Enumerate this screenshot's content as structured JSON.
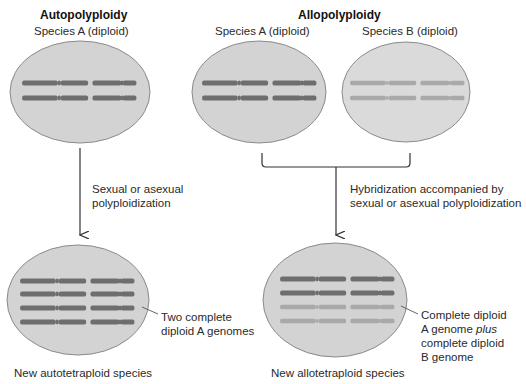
{
  "autopolyploidy": {
    "title": "Autopolyploidy",
    "parent_label": "Species A (diploid)",
    "process_label_line1": "Sexual or asexual",
    "process_label_line2": "polyploidization",
    "result_annotation_line1": "Two complete",
    "result_annotation_line2": "diploid A genomes",
    "result_label": "New autotetraploid species"
  },
  "allopolyploidy": {
    "title": "Allopolyploidy",
    "parent_a_label": "Species A (diploid)",
    "parent_b_label": "Species B (diploid)",
    "process_label_line1": "Hybridization accompanied by",
    "process_label_line2": "sexual or asexual polyploidization",
    "result_annotation_line1": "Complete diploid",
    "result_annotation_line2_prefix": "A genome ",
    "result_annotation_line2_italic": "plus",
    "result_annotation_line3": "complete diploid",
    "result_annotation_line4": "B genome",
    "result_label": "New allotetraploid species"
  },
  "colors": {
    "cell_fill": "#d3d3d3",
    "cell_stroke": "#8a8a8a",
    "genome_a": "#6e6e6e",
    "genome_b": "#a9a9a9",
    "arrow": "#333333"
  }
}
